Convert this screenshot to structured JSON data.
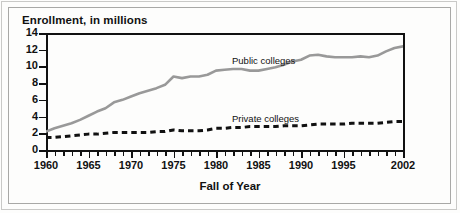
{
  "figure": {
    "y_caption": "Enrollment, in millions",
    "x_caption": "Fall of Year"
  },
  "annotations": {
    "public": "Public colleges",
    "private": "Private colleges"
  },
  "colors": {
    "public_line": "#999999",
    "private_line": "#111111",
    "axis": "#111111",
    "frame": "#a8a8a6",
    "background": "#fdfdfc"
  },
  "chart_data": {
    "type": "line",
    "title": "Enrollment, in millions",
    "xlabel": "Fall of Year",
    "ylabel": "Enrollment, in millions",
    "xlim": [
      1960,
      2002
    ],
    "ylim": [
      0,
      14
    ],
    "yticks": [
      0,
      2,
      4,
      6,
      8,
      10,
      12,
      14
    ],
    "ytick_labels": [
      "0",
      "2",
      "4",
      "6",
      "8",
      "10",
      "12",
      "14"
    ],
    "xticks": [
      1960,
      1965,
      1970,
      1975,
      1980,
      1985,
      1990,
      1995,
      2002
    ],
    "xtick_labels": [
      "1960",
      "1965",
      "1970",
      "1975",
      "1980",
      "1985",
      "1990",
      "1995",
      "2002"
    ],
    "xtick_minor_interval": 1,
    "grid": false,
    "legend": "inline-annotations",
    "x": [
      1960,
      1961,
      1962,
      1963,
      1964,
      1965,
      1966,
      1967,
      1968,
      1969,
      1970,
      1971,
      1972,
      1973,
      1974,
      1975,
      1976,
      1977,
      1978,
      1979,
      1980,
      1981,
      1982,
      1983,
      1984,
      1985,
      1986,
      1987,
      1988,
      1989,
      1990,
      1991,
      1992,
      1993,
      1994,
      1995,
      1996,
      1997,
      1998,
      1999,
      2000,
      2001,
      2002
    ],
    "series": [
      {
        "name": "Public colleges",
        "style": "solid",
        "color": "#999999",
        "values": [
          2.2,
          2.6,
          2.9,
          3.2,
          3.6,
          4.1,
          4.6,
          5.0,
          5.7,
          6.0,
          6.4,
          6.8,
          7.1,
          7.4,
          7.8,
          8.8,
          8.6,
          8.8,
          8.8,
          9.0,
          9.5,
          9.6,
          9.7,
          9.7,
          9.5,
          9.5,
          9.7,
          9.9,
          10.2,
          10.6,
          10.8,
          11.3,
          11.4,
          11.2,
          11.1,
          11.1,
          11.1,
          11.2,
          11.1,
          11.3,
          11.8,
          12.2,
          12.4
        ]
      },
      {
        "name": "Private colleges",
        "style": "dashed",
        "color": "#111111",
        "values": [
          1.5,
          1.5,
          1.6,
          1.7,
          1.8,
          1.9,
          1.9,
          2.0,
          2.1,
          2.1,
          2.1,
          2.1,
          2.1,
          2.2,
          2.2,
          2.4,
          2.3,
          2.3,
          2.3,
          2.4,
          2.6,
          2.6,
          2.7,
          2.7,
          2.8,
          2.8,
          2.8,
          2.8,
          2.9,
          2.9,
          2.9,
          3.0,
          3.1,
          3.1,
          3.1,
          3.1,
          3.2,
          3.2,
          3.2,
          3.2,
          3.3,
          3.4,
          3.4
        ]
      }
    ]
  }
}
